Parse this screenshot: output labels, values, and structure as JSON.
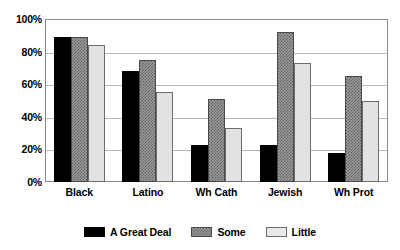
{
  "chart_data": {
    "type": "bar",
    "title": "",
    "subtitle": "",
    "xlabel": "",
    "ylabel": "",
    "categories": [
      "Black",
      "Latino",
      "Wh Cath",
      "Jewish",
      "Wh Prot"
    ],
    "series": [
      {
        "name": "A Great Deal",
        "values": [
          89,
          68,
          23,
          23,
          18
        ],
        "color": "#000000",
        "fill": "solid-black"
      },
      {
        "name": "Some",
        "values": [
          89,
          75,
          51,
          92,
          65
        ],
        "color": "#9c9c9c",
        "fill": "gray-crosshatch"
      },
      {
        "name": "Little",
        "values": [
          84,
          55,
          33,
          73,
          50
        ],
        "color": "#e2e2e2",
        "fill": "light-gray"
      }
    ],
    "ylim": [
      0,
      100
    ],
    "yticks": [
      0,
      20,
      40,
      60,
      80,
      100
    ],
    "ytick_labels": [
      "0%",
      "20%",
      "40%",
      "60%",
      "80%",
      "100%"
    ],
    "grid": true,
    "grid_axis": "y",
    "legend_position": "bottom-center",
    "value_format": "percent",
    "bar_group_layout": "clustered"
  },
  "axes": {
    "y": {
      "ticks": [
        {
          "label": "100%",
          "value": 100
        },
        {
          "label": "80%",
          "value": 80
        },
        {
          "label": "60%",
          "value": 60
        },
        {
          "label": "40%",
          "value": 40
        },
        {
          "label": "20%",
          "value": 20
        },
        {
          "label": "0%",
          "value": 0
        }
      ]
    },
    "x": {
      "ticks": [
        {
          "label": "Black"
        },
        {
          "label": "Latino"
        },
        {
          "label": "Wh Cath"
        },
        {
          "label": "Jewish"
        },
        {
          "label": "Wh Prot"
        }
      ]
    }
  },
  "legend": {
    "items": [
      {
        "label": "A Great Deal",
        "swatch": "solid-black-swatch"
      },
      {
        "label": "Some",
        "swatch": "gray-crosshatch-swatch"
      },
      {
        "label": "Little",
        "swatch": "light-gray-swatch"
      }
    ]
  }
}
